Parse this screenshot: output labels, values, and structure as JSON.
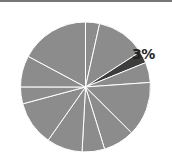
{
  "chart_data": {
    "type": "pie",
    "title": "",
    "start_angle_deg": 0,
    "direction": "clockwise",
    "slices": [
      {
        "value": 3.5,
        "highlight": false
      },
      {
        "value": 12.4,
        "highlight": false
      },
      {
        "value": 3,
        "highlight": true,
        "label": "3%"
      },
      {
        "value": 5.0,
        "highlight": false
      },
      {
        "value": 13.6,
        "highlight": false
      },
      {
        "value": 7.8,
        "highlight": false
      },
      {
        "value": 5.6,
        "highlight": false
      },
      {
        "value": 8.9,
        "highlight": false
      },
      {
        "value": 11.1,
        "highlight": false
      },
      {
        "value": 4.2,
        "highlight": false
      },
      {
        "value": 7.8,
        "highlight": false
      },
      {
        "value": 17.2,
        "highlight": false
      }
    ],
    "colors": {
      "default": "#8c8c8c",
      "highlight": "#3d3d3d",
      "separator": "#ffffff"
    },
    "legend": null
  },
  "label": {
    "highlight_pct": "3%"
  }
}
